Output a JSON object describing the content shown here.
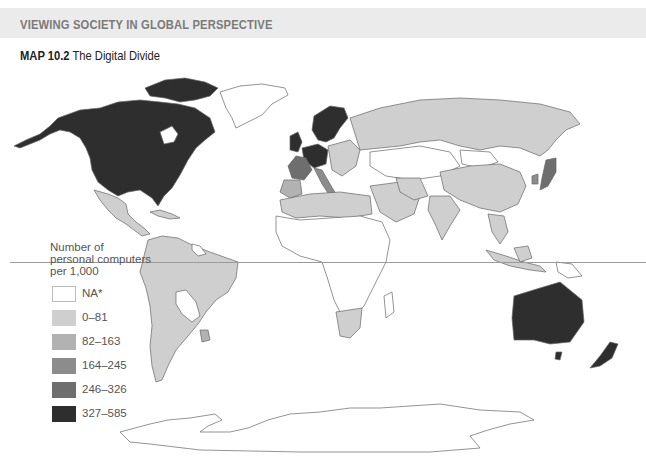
{
  "banner": {
    "label": "VIEWING SOCIETY IN GLOBAL PERSPECTIVE"
  },
  "figure": {
    "number": "MAP 10.2",
    "title": "The Digital Divide"
  },
  "legend": {
    "title_line1": "Number of",
    "title_line2": "personal computers",
    "title_line3": "per 1,000",
    "items": [
      {
        "label": "NA*",
        "color": "#ffffff"
      },
      {
        "label": "0–81",
        "color": "#cfcfcf"
      },
      {
        "label": "82–163",
        "color": "#b2b2b2"
      },
      {
        "label": "164–245",
        "color": "#8c8c8c"
      },
      {
        "label": "246–326",
        "color": "#6e6e6e"
      },
      {
        "label": "327–585",
        "color": "#2e2e2e"
      }
    ]
  },
  "map": {
    "regions": [
      {
        "name": "North America (US/Canada)",
        "class": "327–585"
      },
      {
        "name": "Mexico / Central America",
        "class": "0–81"
      },
      {
        "name": "South America (most)",
        "class": "0–81"
      },
      {
        "name": "Uruguay",
        "class": "82–163"
      },
      {
        "name": "Bolivia / Paraguay / Guianas",
        "class": "NA*"
      },
      {
        "name": "Greenland",
        "class": "NA*"
      },
      {
        "name": "Scandinavia / UK / Germany / Netherlands",
        "class": "327–585"
      },
      {
        "name": "France / Austria",
        "class": "246–326"
      },
      {
        "name": "Italy",
        "class": "164–245"
      },
      {
        "name": "Spain / Portugal",
        "class": "82–163"
      },
      {
        "name": "Russia",
        "class": "0–81"
      },
      {
        "name": "China / India / SE Asia",
        "class": "0–81"
      },
      {
        "name": "Mongolia / Central Asia",
        "class": "NA*"
      },
      {
        "name": "Japan",
        "class": "246–326"
      },
      {
        "name": "South Korea",
        "class": "164–245"
      },
      {
        "name": "North Africa / Middle East",
        "class": "0–81"
      },
      {
        "name": "Sub-Saharan Africa (most)",
        "class": "NA*"
      },
      {
        "name": "South Africa",
        "class": "0–81"
      },
      {
        "name": "Australia / New Zealand",
        "class": "327–585"
      },
      {
        "name": "Antarctica",
        "class": "NA*"
      }
    ]
  }
}
